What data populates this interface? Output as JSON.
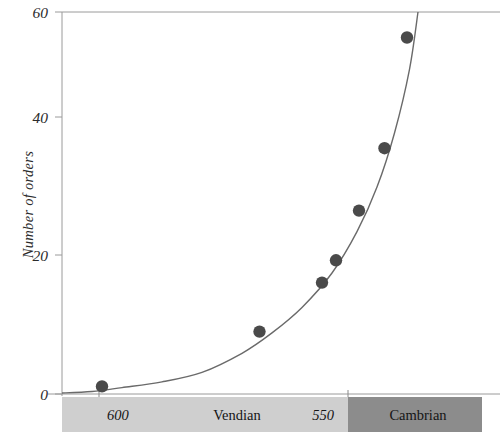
{
  "chart_data": {
    "type": "scatter",
    "title": "",
    "xlabel": "",
    "ylabel": "Number of orders",
    "ylim": [
      0,
      60
    ],
    "yticks": [
      0,
      20,
      40,
      60
    ],
    "ytick_labels": [
      "0",
      "20",
      "40",
      "60"
    ],
    "xlim": [
      612,
      528
    ],
    "xticks": [
      600,
      550
    ],
    "xtick_labels": [
      "600",
      "550"
    ],
    "x_axis_note": "Age in millions of years, decreasing left to right",
    "grid": false,
    "legend": null,
    "points": [
      {
        "x": 604.0,
        "y": 1.2
      },
      {
        "x": 572.5,
        "y": 9.8
      },
      {
        "x": 560.0,
        "y": 17.5
      },
      {
        "x": 557.2,
        "y": 21.0
      },
      {
        "x": 552.6,
        "y": 28.8
      },
      {
        "x": 547.5,
        "y": 38.6
      },
      {
        "x": 543.0,
        "y": 56.0
      }
    ],
    "fit_curve": {
      "style": "exponential",
      "description": "smooth exponential best-fit curve through the points",
      "points": [
        {
          "x": 612.0,
          "y": 0.15
        },
        {
          "x": 606.0,
          "y": 0.4
        },
        {
          "x": 600.0,
          "y": 1.0
        },
        {
          "x": 592.0,
          "y": 1.9
        },
        {
          "x": 584.0,
          "y": 3.4
        },
        {
          "x": 576.0,
          "y": 6.4
        },
        {
          "x": 570.0,
          "y": 9.6
        },
        {
          "x": 564.0,
          "y": 13.6
        },
        {
          "x": 558.0,
          "y": 19.0
        },
        {
          "x": 553.0,
          "y": 25.5
        },
        {
          "x": 549.0,
          "y": 32.5
        },
        {
          "x": 545.5,
          "y": 41.0
        },
        {
          "x": 542.5,
          "y": 51.0
        },
        {
          "x": 540.8,
          "y": 60.0
        }
      ]
    },
    "timescale_bands": [
      {
        "label": "Vendian",
        "from": 612,
        "to": 550,
        "color": "#cfcfcf"
      },
      {
        "label": "Cambrian",
        "from": 550,
        "to": 528,
        "color": "#8c8c8c"
      }
    ]
  },
  "style": {
    "point_color": "#4a4a4a",
    "curve_color": "#6a6a6a",
    "axis_color": "#9a9a9a",
    "text_color": "#2b2b2b",
    "background": "#ffffff"
  }
}
